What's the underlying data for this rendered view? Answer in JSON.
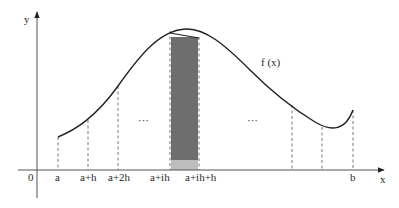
{
  "diagram": {
    "axis_labels": {
      "x": "x",
      "y": "y",
      "origin": "0"
    },
    "function_label": "f (x)",
    "tick_labels": [
      "a",
      "a+h",
      "a+2h",
      "a+ih",
      "a+ih+h",
      "b"
    ],
    "ellipsis": [
      "···",
      "···"
    ],
    "colors": {
      "strip_dark": "#6e6e6e",
      "strip_light": "#bdbdbd",
      "line": "#222222"
    }
  }
}
